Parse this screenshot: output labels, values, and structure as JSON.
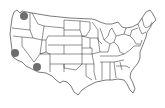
{
  "map": {
    "type": "US states outline",
    "background": "#ffffff",
    "stroke": "#222222",
    "markers": [
      {
        "state": "Washington",
        "x": 24,
        "y": 16,
        "r": 4,
        "color": "#6e6e6e"
      },
      {
        "state": "California",
        "x": 15,
        "y": 53,
        "r": 4,
        "color": "#6e6e6e"
      },
      {
        "state": "Arizona",
        "x": 37,
        "y": 67,
        "r": 4,
        "color": "#6e6e6e"
      }
    ]
  }
}
